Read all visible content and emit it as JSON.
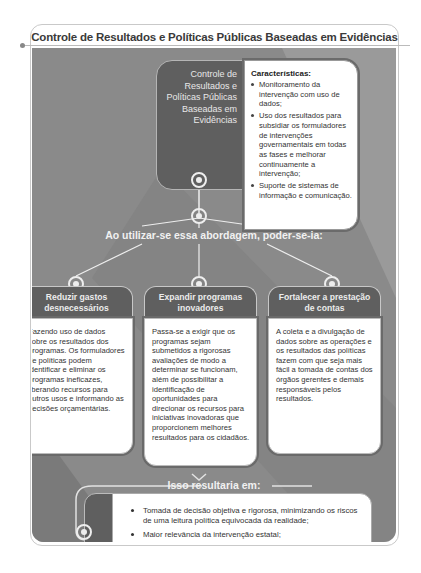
{
  "title": "Controle de Resultados e Políticas Públicas Baseadas em Evidências",
  "hub": {
    "label_lines": [
      "Controle de",
      "Resultados e",
      "Políticas Públicas",
      "Baseadas em",
      "Evidências"
    ]
  },
  "characteristics": {
    "title": "Características:",
    "items": [
      "Monitoramento da intervenção com uso de dados;",
      "Uso dos resultados para subsidiar os formuladores de intervenções governamentais em todas as fases e melhorar continuamente a intervenção;",
      "Suporte de sistemas de informação e comunicação."
    ]
  },
  "approach_label": "Ao utilizar-se essa abordagem, poder-se-ia:",
  "columns": [
    {
      "heading": "Reduzir gastos desnecessários",
      "body": "Fazendo uso de dados sobre os resultados dos programas. Os formuladores de políticas podem identificar e eliminar os programas ineficazes, liberando recursos para outros usos e informando as decisões orçamentárias."
    },
    {
      "heading": "Expandir programas inovadores",
      "body": "Passa-se a exigir que os programas sejam submetidos a rigorosas avaliações de modo a determinar se funcionam, além de possibilitar a identificação de oportunidades para direcionar os recursos para iniciativas inovadoras que proporcionem melhores resultados para os cidadãos."
    },
    {
      "heading": "Fortalecer a prestação de contas",
      "body": "A coleta e a divulgação de dados sobre as operações e os resultados das políticas fazem com que seja mais fácil a tomada de contas dos órgãos gerentes e demais responsáveis pelos resultados."
    }
  ],
  "result": {
    "title": "Isso resultaria em:",
    "items": [
      "Tomada de decisão objetiva e rigorosa, minimizando os riscos de uma leitura política equivocada da realidade;",
      "Maior relevância da intervenção estatal;",
      "Uso inteligente e efetivo dos recursos dos contribuintes."
    ]
  },
  "colors": {
    "panel": "#8a8a8a",
    "dark_box": "#5f5f5f",
    "light_line": "#eeeeee",
    "text_dark": "#333333"
  }
}
